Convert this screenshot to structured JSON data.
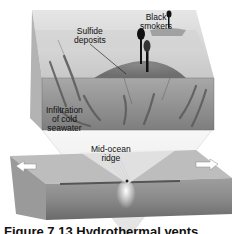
{
  "figure": {
    "labels": {
      "black_smokers": "Black smokers",
      "black_smokers_line1": "Black",
      "black_smokers_line2": "smokers",
      "sulfide_deposits_line1": "Sulfide",
      "sulfide_deposits_line2": "deposits",
      "infiltration_line1": "Infiltration",
      "infiltration_line2": "of cold",
      "infiltration_line3": "seawater",
      "ridge_line1": "Mid-ocean",
      "ridge_line2": "ridge"
    },
    "caption": "Figure 7.13 Hydrothermal vents",
    "colors": {
      "block_top": "#d9d9d9",
      "block_front": "#9a9a9a",
      "block_side": "#bdbdbd",
      "mound": "#7d7d7d",
      "smoker": "#111111",
      "slab_top": "#bcbcbc",
      "slab_front": "#8c8c8c",
      "cone": "#f0f0f0"
    }
  }
}
